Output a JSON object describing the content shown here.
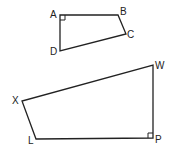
{
  "diagram": {
    "type": "geometry",
    "shapes": [
      {
        "name": "ABCD",
        "vertices": [
          {
            "label": "A",
            "x": 60,
            "y": 15
          },
          {
            "label": "B",
            "x": 118,
            "y": 15
          },
          {
            "label": "C",
            "x": 126,
            "y": 34
          },
          {
            "label": "D",
            "x": 60,
            "y": 51
          }
        ],
        "right_angle_at": "A"
      },
      {
        "name": "WPLX",
        "vertices": [
          {
            "label": "W",
            "x": 153,
            "y": 65
          },
          {
            "label": "P",
            "x": 153,
            "y": 138
          },
          {
            "label": "L",
            "x": 36,
            "y": 139
          },
          {
            "label": "X",
            "x": 22,
            "y": 101
          }
        ],
        "right_angle_at": "P"
      }
    ],
    "labels": {
      "A": "A",
      "B": "B",
      "C": "C",
      "D": "D",
      "W": "W",
      "P": "P",
      "L": "L",
      "X": "X"
    }
  }
}
